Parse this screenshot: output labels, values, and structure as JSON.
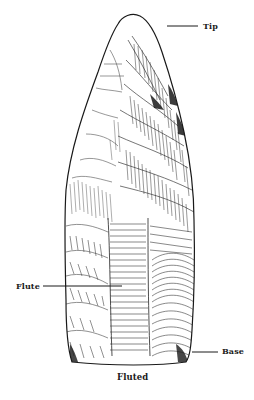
{
  "figure": {
    "caption": "Fluted",
    "ink_color": "#1a1a1a",
    "background_color": "#ffffff"
  },
  "labels": [
    {
      "id": "tip",
      "text": "Tip"
    },
    {
      "id": "flute",
      "text": "Flute"
    },
    {
      "id": "base",
      "text": "Base"
    }
  ]
}
